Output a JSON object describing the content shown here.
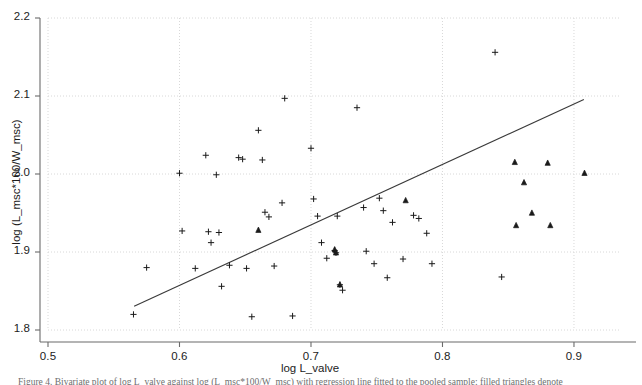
{
  "figure": {
    "background_color": "#ffffff",
    "axis_color": "#6b6b6b",
    "grid_color": "#d8d8d8",
    "marker_color": "#1a1a1a",
    "fit_line_color": "#3a3a3a",
    "caption": "Figure 4. Bivariate plot of log L_valve against log (L_msc*100/W_msc) with regression line fitted to the pooled sample; filled triangles denote"
  },
  "chart_data": {
    "type": "scatter",
    "title": "",
    "subtitle": "",
    "xlabel": "log L_valve",
    "ylabel": "log (L_msc*100/W_msc)",
    "xlim": [
      0.5,
      0.935
    ],
    "ylim": [
      1.8,
      2.2
    ],
    "xticks": [
      "0.5",
      "0.6",
      "0.7",
      "0.8",
      "0.9"
    ],
    "xtick_values": [
      0.5,
      0.6,
      0.7,
      0.8,
      0.9
    ],
    "yticks": [
      "1.8",
      "1.9",
      "2.0",
      "2.1",
      "2.2"
    ],
    "ytick_values": [
      1.8,
      1.9,
      2.0,
      2.1,
      2.2
    ],
    "grid": true,
    "grid_style": "dotted",
    "legend": "none",
    "legend_position": "none",
    "series": [
      {
        "name": "plus-marker-group",
        "marker": "plus",
        "filled": false,
        "points": [
          [
            0.565,
            1.82
          ],
          [
            0.575,
            1.88
          ],
          [
            0.6,
            2.001
          ],
          [
            0.602,
            1.927
          ],
          [
            0.612,
            1.879
          ],
          [
            0.62,
            2.024
          ],
          [
            0.622,
            1.926
          ],
          [
            0.624,
            1.912
          ],
          [
            0.628,
            1.999
          ],
          [
            0.63,
            1.925
          ],
          [
            0.632,
            1.856
          ],
          [
            0.638,
            1.883
          ],
          [
            0.645,
            2.021
          ],
          [
            0.648,
            2.019
          ],
          [
            0.651,
            1.879
          ],
          [
            0.655,
            1.817
          ],
          [
            0.66,
            2.056
          ],
          [
            0.663,
            2.018
          ],
          [
            0.665,
            1.951
          ],
          [
            0.668,
            1.945
          ],
          [
            0.672,
            1.882
          ],
          [
            0.678,
            1.963
          ],
          [
            0.68,
            2.097
          ],
          [
            0.686,
            1.818
          ],
          [
            0.7,
            2.033
          ],
          [
            0.702,
            1.968
          ],
          [
            0.705,
            1.946
          ],
          [
            0.708,
            1.912
          ],
          [
            0.712,
            1.892
          ],
          [
            0.718,
            1.902
          ],
          [
            0.719,
            1.899
          ],
          [
            0.72,
            1.946
          ],
          [
            0.722,
            1.858
          ],
          [
            0.724,
            1.851
          ],
          [
            0.735,
            2.085
          ],
          [
            0.74,
            1.957
          ],
          [
            0.742,
            1.901
          ],
          [
            0.748,
            1.885
          ],
          [
            0.752,
            1.969
          ],
          [
            0.755,
            1.953
          ],
          [
            0.758,
            1.867
          ],
          [
            0.762,
            1.938
          ],
          [
            0.77,
            1.891
          ],
          [
            0.778,
            1.947
          ],
          [
            0.782,
            1.943
          ],
          [
            0.788,
            1.924
          ],
          [
            0.792,
            1.885
          ],
          [
            0.84,
            2.156
          ],
          [
            0.845,
            1.868
          ]
        ]
      },
      {
        "name": "filled-triangle-group",
        "marker": "triangle",
        "filled": true,
        "points": [
          [
            0.66,
            1.928
          ],
          [
            0.718,
            1.903
          ],
          [
            0.719,
            1.899
          ],
          [
            0.722,
            1.858
          ],
          [
            0.772,
            1.966
          ],
          [
            0.855,
            2.015
          ],
          [
            0.856,
            1.934
          ],
          [
            0.862,
            1.989
          ],
          [
            0.868,
            1.95
          ],
          [
            0.88,
            2.014
          ],
          [
            0.882,
            1.934
          ],
          [
            0.908,
            2.001
          ]
        ]
      }
    ],
    "fit_line": {
      "name": "regression-line",
      "x_start": 0.5655,
      "y_start": 1.8305,
      "x_end": 0.9075,
      "y_end": 2.0955
    }
  }
}
